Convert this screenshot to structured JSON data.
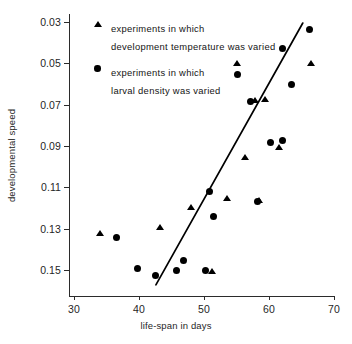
{
  "chart_data": {
    "type": "scatter",
    "title": "",
    "xlabel": "life-span in days",
    "ylabel": "developmental speed",
    "xlim": [
      30,
      70
    ],
    "ylim": [
      0.16,
      0.021
    ],
    "y_axis_inverted": true,
    "grid": false,
    "xticks": [
      30,
      40,
      50,
      60,
      70
    ],
    "xtick_labels": [
      "30",
      "40",
      "50",
      "60",
      "70"
    ],
    "yticks": [
      0.03,
      0.05,
      0.07,
      0.09,
      0.11,
      0.13,
      0.15
    ],
    "ytick_labels": [
      "0.03",
      "0.05",
      "0.07",
      "0.09",
      "0.11",
      "0.13",
      "0.15"
    ],
    "legend_position": "upper left",
    "series": [
      {
        "name": "experiments in which development temperature was varied",
        "marker": "triangle",
        "color": "#000000",
        "points": [
          {
            "x": 34.1,
            "y": 0.1325
          },
          {
            "x": 43.3,
            "y": 0.1295
          },
          {
            "x": 48.0,
            "y": 0.12
          },
          {
            "x": 51.2,
            "y": 0.151
          },
          {
            "x": 53.6,
            "y": 0.1155
          },
          {
            "x": 55.1,
            "y": 0.05
          },
          {
            "x": 56.4,
            "y": 0.0955
          },
          {
            "x": 57.9,
            "y": 0.068
          },
          {
            "x": 58.5,
            "y": 0.1165
          },
          {
            "x": 59.4,
            "y": 0.0675
          },
          {
            "x": 61.6,
            "y": 0.091
          },
          {
            "x": 66.5,
            "y": 0.05
          }
        ]
      },
      {
        "name": "experiments in which larval density was varied",
        "marker": "circle",
        "color": "#000000",
        "points": [
          {
            "x": 36.6,
            "y": 0.1345
          },
          {
            "x": 39.7,
            "y": 0.1495
          },
          {
            "x": 42.6,
            "y": 0.1525
          },
          {
            "x": 45.7,
            "y": 0.15
          },
          {
            "x": 46.8,
            "y": 0.1455
          },
          {
            "x": 50.3,
            "y": 0.15
          },
          {
            "x": 50.9,
            "y": 0.112
          },
          {
            "x": 51.5,
            "y": 0.124
          },
          {
            "x": 55.2,
            "y": 0.0555
          },
          {
            "x": 58.3,
            "y": 0.117
          },
          {
            "x": 57.2,
            "y": 0.0685
          },
          {
            "x": 60.2,
            "y": 0.0885
          },
          {
            "x": 62.0,
            "y": 0.0875
          },
          {
            "x": 62.0,
            "y": 0.043
          },
          {
            "x": 63.4,
            "y": 0.06
          },
          {
            "x": 66.3,
            "y": 0.0335
          }
        ]
      }
    ],
    "trend_line": {
      "x_start": 42.6,
      "y_start": 0.1572,
      "x_end": 65.2,
      "y_end": 0.0305
    }
  },
  "legend": {
    "entries": [
      {
        "marker": "triangle",
        "label": "experiments in which\ndevelopment temperature was varied"
      },
      {
        "marker": "circle",
        "label": "experiments in which\nlarval density was varied"
      }
    ]
  }
}
